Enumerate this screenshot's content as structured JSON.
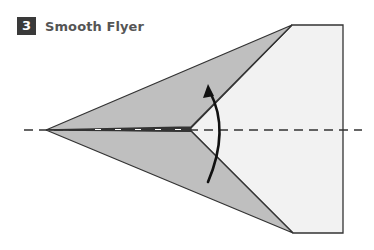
{
  "header": {
    "step_number": "3",
    "title": "Smooth Flyer"
  },
  "diagram": {
    "colors": {
      "wing_fill": "#bfbfbf",
      "paper_fill": "#f2f2f2",
      "outline": "#333333",
      "badge": "#3a3a3a",
      "arrow": "#111111"
    },
    "elements": [
      {
        "name": "center-fold-line",
        "style": "dashed"
      },
      {
        "name": "fold-arrow",
        "direction": "up"
      }
    ]
  }
}
